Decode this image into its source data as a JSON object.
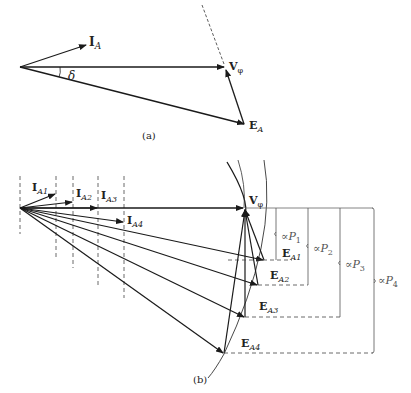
{
  "figure_a": {
    "caption": "(a)",
    "labels": {
      "current": "I",
      "current_sub": "A",
      "voltage": "V",
      "voltage_sub": "φ",
      "emf": "E",
      "emf_sub": "A",
      "angle": "δ"
    }
  },
  "figure_b": {
    "caption": "(b)",
    "voltage_label": "V",
    "voltage_sub": "φ",
    "currents": [
      {
        "label": "I",
        "sub": "A1"
      },
      {
        "label": "I",
        "sub": "A2"
      },
      {
        "label": "I",
        "sub": "A3"
      },
      {
        "label": "I",
        "sub": "A4"
      }
    ],
    "emfs": [
      {
        "label": "E",
        "sub": "A1"
      },
      {
        "label": "E",
        "sub": "A2"
      },
      {
        "label": "E",
        "sub": "A3"
      },
      {
        "label": "E",
        "sub": "A4"
      }
    ],
    "power_brackets": [
      {
        "prefix": "∝",
        "label": "P",
        "sub": "1"
      },
      {
        "prefix": "∝",
        "label": "P",
        "sub": "2"
      },
      {
        "prefix": "∝",
        "label": "P",
        "sub": "3"
      },
      {
        "prefix": "∝",
        "label": "P",
        "sub": "4"
      }
    ]
  },
  "colors": {
    "stroke": "#1a1a1a",
    "light_stroke": "#555555"
  }
}
